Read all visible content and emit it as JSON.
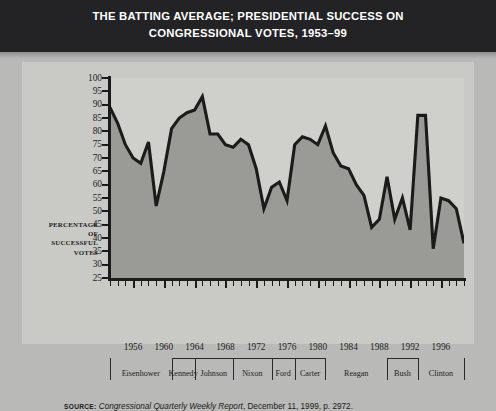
{
  "title": {
    "line1": "THE BATTING AVERAGE; PRESIDENTIAL SUCCESS ON",
    "line2": "CONGRESSIONAL VOTES, 1953–99"
  },
  "axis_title": {
    "l1": "PERCENTAGE",
    "l2": "OF",
    "l3": "SUCCESSFUL",
    "l4": "VOTES"
  },
  "source": {
    "key": "SOURCE:",
    "italic": " Congressional Quarterly Weekly Report",
    "rest": ", December 11, 1999, p. 2972."
  },
  "colors": {
    "title_band": "#232326",
    "page_bg": "#b9b9b7",
    "figure_bg": "#c9c9c6",
    "plot_bg": "#cfcfcc",
    "area_fill": "#9a9a96",
    "line": "#1b1b1b",
    "axis": "#1b1b1b"
  },
  "chart_data": {
    "type": "line",
    "title": "THE BATTING AVERAGE; PRESIDENTIAL SUCCESS ON CONGRESSIONAL VOTES, 1953–99",
    "xlabel": "",
    "ylabel": "PERCENTAGE OF SUCCESSFUL VOTES",
    "ylim": [
      25,
      100
    ],
    "ytick_step": 5,
    "yticks": [
      25,
      30,
      35,
      40,
      45,
      50,
      55,
      60,
      65,
      70,
      75,
      80,
      85,
      90,
      95,
      100
    ],
    "xlim": [
      1953,
      1999
    ],
    "xticks": [
      1956,
      1960,
      1964,
      1968,
      1972,
      1976,
      1980,
      1984,
      1988,
      1992,
      1996
    ],
    "xtick_every_year": true,
    "grid": false,
    "legend": "none",
    "fill_below": true,
    "x": [
      1953,
      1954,
      1955,
      1956,
      1957,
      1958,
      1959,
      1960,
      1961,
      1962,
      1963,
      1964,
      1965,
      1966,
      1967,
      1968,
      1969,
      1970,
      1971,
      1972,
      1973,
      1974,
      1975,
      1976,
      1977,
      1978,
      1979,
      1980,
      1981,
      1982,
      1983,
      1984,
      1985,
      1986,
      1987,
      1988,
      1989,
      1990,
      1991,
      1992,
      1993,
      1994,
      1995,
      1996,
      1997,
      1998,
      1999
    ],
    "values": [
      89,
      83,
      75,
      70,
      68,
      76,
      52,
      65,
      81,
      85,
      87,
      88,
      93,
      79,
      79,
      75,
      74,
      77,
      75,
      66,
      51,
      59,
      61,
      54,
      75,
      78,
      77,
      75,
      82,
      72,
      67,
      66,
      60,
      56,
      44,
      47,
      63,
      47,
      55,
      43,
      86,
      86,
      36,
      55,
      54,
      51,
      38
    ],
    "series": [
      {
        "name": "Presidential success on congressional votes",
        "values": [
          89,
          83,
          75,
          70,
          68,
          76,
          52,
          65,
          81,
          85,
          87,
          88,
          93,
          79,
          79,
          75,
          74,
          77,
          75,
          66,
          51,
          59,
          61,
          54,
          75,
          78,
          77,
          75,
          82,
          72,
          67,
          66,
          60,
          56,
          44,
          47,
          63,
          47,
          55,
          43,
          86,
          86,
          36,
          55,
          54,
          51,
          38
        ]
      }
    ],
    "presidential_terms": [
      {
        "name": "Eisenhower",
        "start": 1953,
        "end": 1961
      },
      {
        "name": "Kennedy",
        "start": 1961,
        "end": 1964
      },
      {
        "name": "Johnson",
        "start": 1964,
        "end": 1969
      },
      {
        "name": "Nixon",
        "start": 1969,
        "end": 1974
      },
      {
        "name": "Ford",
        "start": 1974,
        "end": 1977
      },
      {
        "name": "Carter",
        "start": 1977,
        "end": 1981
      },
      {
        "name": "Reagan",
        "start": 1981,
        "end": 1989
      },
      {
        "name": "Bush",
        "start": 1989,
        "end": 1993
      },
      {
        "name": "Clinton",
        "start": 1993,
        "end": 1999
      }
    ]
  }
}
